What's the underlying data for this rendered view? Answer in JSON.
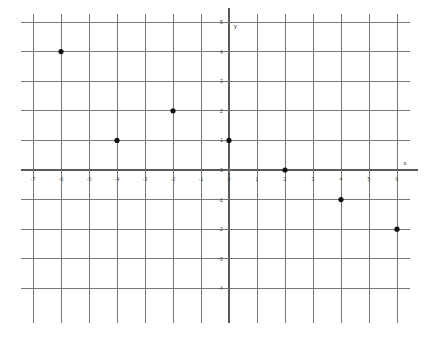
{
  "chart_data": {
    "type": "scatter",
    "title": "",
    "xlabel": "x",
    "ylabel": "y",
    "grid": true,
    "legend": "none",
    "xlim": [
      -7.3,
      6.8
    ],
    "ylim": [
      -4.8,
      5.3
    ],
    "x_ticks": [
      -7,
      -6,
      -5,
      -4,
      -3,
      -2,
      -1,
      0,
      1,
      2,
      3,
      4,
      5,
      6
    ],
    "x_tick_labels": [
      "-7",
      "-6",
      "-5",
      "-4",
      "-3",
      "-2",
      "-1",
      "0",
      "1",
      "2",
      "3",
      "4",
      "5",
      "6"
    ],
    "y_ticks": [
      5,
      4,
      3,
      2,
      1,
      0,
      -1,
      -2,
      -3,
      -4
    ],
    "y_tick_labels": [
      "5",
      "4",
      "3",
      "2",
      "1",
      "0",
      "-1",
      "-2",
      "-3",
      "-4"
    ],
    "grid_x": [
      -7,
      -6,
      -5,
      -4,
      -3,
      -2,
      -1,
      0,
      1,
      2,
      3,
      4,
      5,
      6
    ],
    "grid_y": [
      5,
      4,
      3,
      2,
      1,
      0,
      -1,
      -2,
      -3,
      -4
    ],
    "points": [
      {
        "x": -6,
        "y": 4,
        "label": "(-6, 4)"
      },
      {
        "x": -4,
        "y": 1,
        "label": "(-4, 1)"
      },
      {
        "x": -2,
        "y": 2,
        "label": "(-2, 2)"
      },
      {
        "x": 0,
        "y": 1,
        "label": "(0, 1)"
      },
      {
        "x": 2,
        "y": 0,
        "label": "(2, 0)"
      },
      {
        "x": 4,
        "y": -1,
        "label": "(4, -1)"
      },
      {
        "x": 6,
        "y": -2,
        "label": "(6, -2)"
      }
    ],
    "point_color": "#111111",
    "grid_color": "#767676",
    "axis_color": "#5a5a5a",
    "background_color": "#ffffff"
  },
  "labels": {
    "x_axis_name": "x",
    "y_axis_name": "y",
    "origin_x_label": "0",
    "origin_y_label": "0"
  }
}
